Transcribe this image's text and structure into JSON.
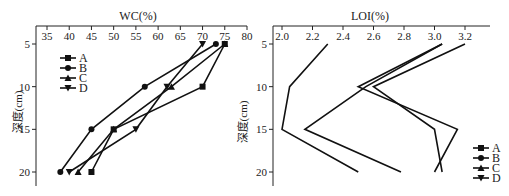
{
  "chart_data": [
    {
      "type": "line",
      "title": "WC(%)",
      "xlabel": "WC(%)",
      "ylabel": "深度(cm)",
      "xlim": [
        32,
        80
      ],
      "ylim": [
        23,
        3
      ],
      "x_ticks": [
        35,
        40,
        45,
        50,
        55,
        60,
        65,
        70,
        75,
        80
      ],
      "y_ticks": [
        5,
        10,
        15,
        20
      ],
      "y_inverted": true,
      "x_axis_position": "top",
      "grid": false,
      "legend_position": "upper-left",
      "depth": [
        5,
        10,
        15,
        20
      ],
      "series": [
        {
          "name": "A",
          "marker": "square",
          "values": [
            75,
            70,
            50,
            45
          ]
        },
        {
          "name": "B",
          "marker": "circle",
          "values": [
            73,
            57,
            45,
            38
          ]
        },
        {
          "name": "C",
          "marker": "triangle-up",
          "values": [
            75,
            63,
            50,
            42
          ]
        },
        {
          "name": "D",
          "marker": "triangle-down",
          "values": [
            70,
            62,
            55,
            40
          ]
        }
      ]
    },
    {
      "type": "line",
      "title": "LOI(%)",
      "xlabel": "LOI(%)",
      "ylabel": "深度(cm)",
      "xlim": [
        1.95,
        3.35
      ],
      "ylim": [
        23,
        3
      ],
      "x_ticks": [
        2.0,
        2.2,
        2.4,
        2.6,
        2.8,
        3.0,
        3.2
      ],
      "y_ticks": [
        5,
        10,
        15,
        20
      ],
      "y_inverted": true,
      "x_axis_position": "top",
      "grid": false,
      "legend_position": "lower-right",
      "depth": [
        5,
        10,
        15,
        20
      ],
      "series": [
        {
          "name": "A",
          "marker": "square",
          "values": [
            2.3,
            2.05,
            2.0,
            2.5
          ]
        },
        {
          "name": "B",
          "marker": "circle",
          "values": [
            3.05,
            2.55,
            2.15,
            2.78
          ]
        },
        {
          "name": "C",
          "marker": "triangle-up",
          "values": [
            3.05,
            2.5,
            3.15,
            3.0
          ]
        },
        {
          "name": "D",
          "marker": "triangle-down",
          "values": [
            3.2,
            2.6,
            3.0,
            3.05
          ]
        }
      ]
    }
  ],
  "wc": {
    "title": "WC(%)",
    "ylabel": "深度(cm)",
    "x_tick_labels": [
      "35",
      "40",
      "45",
      "50",
      "55",
      "60",
      "65",
      "70",
      "75",
      "80"
    ],
    "y_tick_labels": [
      "5",
      "10",
      "15",
      "20"
    ],
    "legend": [
      "A",
      "B",
      "C",
      "D"
    ]
  },
  "loi": {
    "title": "LOI(%)",
    "ylabel": "深度(cm)",
    "x_tick_labels": [
      "2.0",
      "2.2",
      "2.4",
      "2.6",
      "2.8",
      "3.0",
      "3.2"
    ],
    "y_tick_labels": [
      "5",
      "10",
      "15",
      "20"
    ],
    "legend": [
      "A",
      "B",
      "C",
      "D"
    ]
  }
}
